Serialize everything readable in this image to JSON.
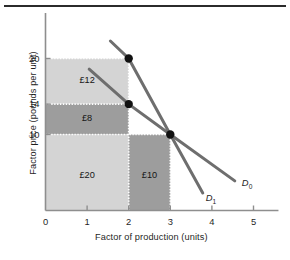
{
  "figure": {
    "has_top_rule": true,
    "background": "#ffffff"
  },
  "chart_data": {
    "type": "line",
    "title": "",
    "xlabel": "Factor of production (units)",
    "ylabel": "Factor price (pounds per unit)",
    "xlim": [
      0,
      5.6
    ],
    "ylim": [
      0,
      23
    ],
    "xticks": [
      0,
      1,
      2,
      3,
      4,
      5
    ],
    "xtick_labels": [
      "0",
      "1",
      "2",
      "3",
      "4",
      "5"
    ],
    "yticks": [
      10,
      14,
      20
    ],
    "ytick_labels": [
      "10",
      "14",
      "20"
    ],
    "grid": false,
    "legend_position": "inline-right",
    "series": [
      {
        "name": "D0",
        "label": "D",
        "subscript": "0",
        "color": "#6e6e6e",
        "points": [
          [
            1.05,
            18.6
          ],
          [
            2.0,
            14.0
          ],
          [
            3.0,
            10.0
          ],
          [
            4.55,
            3.9
          ]
        ],
        "label_x": 4.72,
        "label_y": 3.6
      },
      {
        "name": "D1",
        "label": "D",
        "subscript": "1",
        "color": "#6e6e6e",
        "points": [
          [
            1.56,
            22.3
          ],
          [
            2.0,
            20.0
          ],
          [
            3.0,
            10.0
          ],
          [
            3.78,
            2.3
          ]
        ],
        "label_x": 3.85,
        "label_y": 1.6
      }
    ],
    "markers": [
      {
        "name": "point-2-20",
        "x": 2.0,
        "y": 20.0,
        "color": "#111111"
      },
      {
        "name": "point-2-14",
        "x": 2.0,
        "y": 14.0,
        "color": "#111111"
      },
      {
        "name": "point-3-10",
        "x": 3.0,
        "y": 10.0,
        "color": "#111111"
      }
    ],
    "regions": [
      {
        "name": "region-12",
        "label": "£12",
        "x0": 0,
        "x1": 2,
        "y0": 14,
        "y1": 20,
        "fill": "#d4d4d4",
        "label_x": 1.0,
        "label_y": 17.0
      },
      {
        "name": "region-8",
        "label": "£8",
        "x0": 0,
        "x1": 2,
        "y0": 10,
        "y1": 14,
        "fill": "#9d9d9d",
        "label_x": 1.0,
        "label_y": 12.0
      },
      {
        "name": "region-20",
        "label": "£20",
        "x0": 0,
        "x1": 2,
        "y0": 0,
        "y1": 10,
        "fill": "#d4d4d4",
        "label_x": 1.0,
        "label_y": 4.6
      },
      {
        "name": "region-10",
        "label": "£10",
        "x0": 2,
        "x1": 3,
        "y0": 0,
        "y1": 10,
        "fill": "#9d9d9d",
        "label_x": 2.5,
        "label_y": 4.6
      }
    ],
    "dotted_guides": [
      {
        "name": "guide-y20",
        "from": [
          0,
          20
        ],
        "to": [
          2,
          20
        ]
      },
      {
        "name": "guide-y14",
        "from": [
          0,
          14
        ],
        "to": [
          2,
          14
        ]
      },
      {
        "name": "guide-y10",
        "from": [
          0,
          10
        ],
        "to": [
          3,
          10
        ]
      },
      {
        "name": "guide-x2",
        "from": [
          2,
          0
        ],
        "to": [
          2,
          20
        ]
      },
      {
        "name": "guide-x3",
        "from": [
          3,
          0
        ],
        "to": [
          3,
          10
        ]
      }
    ],
    "axis_color": "#8e8e8e",
    "curve_color": "#6e6e6e",
    "marker_color": "#111111"
  }
}
